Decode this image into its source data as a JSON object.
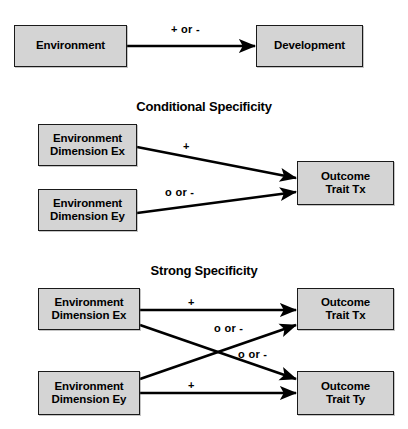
{
  "figure": {
    "panels": [
      {
        "id": "general",
        "title": "",
        "nodes": [
          {
            "id": "environment",
            "lines": [
              "Environment"
            ]
          },
          {
            "id": "development",
            "lines": [
              "Development"
            ]
          }
        ],
        "edges": [
          {
            "id": "env-to-dev",
            "from": "environment",
            "to": "development",
            "label": "+ or -"
          }
        ]
      },
      {
        "id": "conditional",
        "title": "Conditional Specificity",
        "nodes": [
          {
            "id": "env-dim-ex",
            "lines": [
              "Environment",
              "Dimension Ex"
            ]
          },
          {
            "id": "env-dim-ey",
            "lines": [
              "Environment",
              "Dimension Ey"
            ]
          },
          {
            "id": "outcome-trait-tx",
            "lines": [
              "Outcome",
              "Trait Tx"
            ]
          }
        ],
        "edges": [
          {
            "id": "ex-to-tx",
            "from": "env-dim-ex",
            "to": "outcome-trait-tx",
            "label": "+"
          },
          {
            "id": "ey-to-tx",
            "from": "env-dim-ey",
            "to": "outcome-trait-tx",
            "label": "o or -"
          }
        ]
      },
      {
        "id": "strong",
        "title": "Strong Specificity",
        "nodes": [
          {
            "id": "env-dim-ex2",
            "lines": [
              "Environment",
              "Dimension Ex"
            ]
          },
          {
            "id": "env-dim-ey2",
            "lines": [
              "Environment",
              "Dimension Ey"
            ]
          },
          {
            "id": "outcome-trait-tx2",
            "lines": [
              "Outcome",
              "Trait Tx"
            ]
          },
          {
            "id": "outcome-trait-ty",
            "lines": [
              "Outcome",
              "Trait Ty"
            ]
          }
        ],
        "edges": [
          {
            "id": "ex-to-tx2",
            "from": "env-dim-ex2",
            "to": "outcome-trait-tx2",
            "label": "+"
          },
          {
            "id": "ey-to-ty",
            "from": "env-dim-ey2",
            "to": "outcome-trait-ty",
            "label": "+"
          },
          {
            "id": "ey-to-tx2",
            "from": "env-dim-ey2",
            "to": "outcome-trait-tx2",
            "label": "o or -"
          },
          {
            "id": "ex-to-ty",
            "from": "env-dim-ex2",
            "to": "outcome-trait-ty",
            "label": "o or -"
          }
        ]
      }
    ],
    "colors": {
      "node_fill": "#d4d4d4",
      "node_border": "#1a1a1a",
      "arrow": "#000000",
      "text": "#000000",
      "background": "#ffffff"
    }
  }
}
